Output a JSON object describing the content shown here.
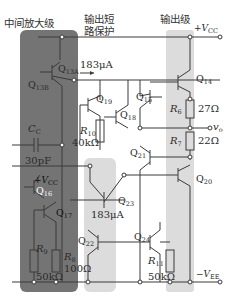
{
  "stages": {
    "middle_amp": "中间放大级",
    "short_protect_line1": "输出短",
    "short_protect_line2": "路保护",
    "output": "输出级"
  },
  "supplies": {
    "vcc": "+V",
    "vcc_sub": "CC",
    "vee": "−V",
    "vee_sub": "EE",
    "vcc_local": "+V",
    "vcc_local_sub": "CC"
  },
  "output_node": {
    "label": "v",
    "sub": "o"
  },
  "currents": {
    "i13a": "183μA",
    "i23": "183μA"
  },
  "transistors": {
    "q13a": {
      "name": "Q",
      "sub": "13A"
    },
    "q13b": {
      "name": "Q",
      "sub": "13B"
    },
    "q14": {
      "name": "Q",
      "sub": "14"
    },
    "q15": {
      "name": "Q",
      "sub": "15"
    },
    "q16": {
      "name": "Q",
      "sub": "16"
    },
    "q17": {
      "name": "Q",
      "sub": "17"
    },
    "q18": {
      "name": "Q",
      "sub": "18"
    },
    "q19": {
      "name": "Q",
      "sub": "19"
    },
    "q20": {
      "name": "Q",
      "sub": "20"
    },
    "q21": {
      "name": "Q",
      "sub": "21"
    },
    "q22": {
      "name": "Q",
      "sub": "22"
    },
    "q23": {
      "name": "Q",
      "sub": "23"
    },
    "q24": {
      "name": "Q",
      "sub": "24"
    }
  },
  "capacitor": {
    "name": "C",
    "sub": "C",
    "value": "30pF"
  },
  "resistors": {
    "r6": {
      "name": "R",
      "sub": "6",
      "value": "27Ω"
    },
    "r7": {
      "name": "R",
      "sub": "7",
      "value": "22Ω"
    },
    "r8": {
      "name": "R",
      "sub": "8",
      "value": "100Ω"
    },
    "r9": {
      "name": "R",
      "sub": "9",
      "value": "50kΩ"
    },
    "r10": {
      "name": "R",
      "sub": "10",
      "value": "40kΩ"
    },
    "r11": {
      "name": "R",
      "sub": "11",
      "value": "50kΩ"
    }
  },
  "colors": {
    "middle_stage_bg": "#6e6e6e",
    "highlight_bg": "#dcdcdc",
    "wire": "#3a3a3a"
  }
}
